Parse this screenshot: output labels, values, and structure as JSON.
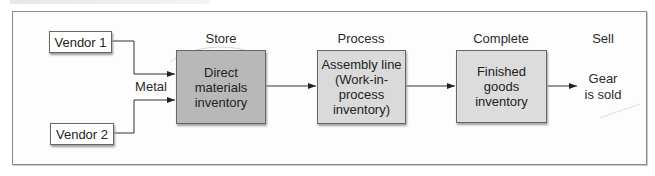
{
  "diagram": {
    "colors": {
      "raw_materials_fill": "#b8b8b8",
      "wip_fill": "#dadada",
      "finished_fill": "#dcdcdc",
      "line": "#333333",
      "frame": "#8a8a8a"
    },
    "vendors": [
      {
        "label": "Vendor 1"
      },
      {
        "label": "Vendor 2"
      }
    ],
    "input_label": "Metal",
    "stages": [
      {
        "label": "Store",
        "box_text": "Direct\nmaterials\ninventory"
      },
      {
        "label": "Process",
        "box_text": "Assembly line\n(Work-in-\nprocess\ninventory)"
      },
      {
        "label": "Complete",
        "box_text": "Finished\ngoods\ninventory"
      },
      {
        "label": "Sell",
        "box_text": "Gear\nis sold"
      }
    ],
    "flow": [
      {
        "from": "Vendor 1",
        "to": "Direct materials inventory"
      },
      {
        "from": "Vendor 2",
        "to": "Direct materials inventory"
      },
      {
        "from": "Direct materials inventory",
        "to": "Assembly line (Work-in-process inventory)"
      },
      {
        "from": "Assembly line (Work-in-process inventory)",
        "to": "Finished goods inventory"
      },
      {
        "from": "Finished goods inventory",
        "to": "Gear is sold"
      }
    ]
  }
}
